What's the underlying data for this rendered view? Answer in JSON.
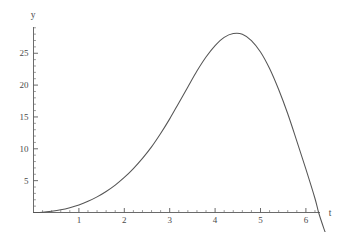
{
  "figure": {
    "kind": "mathematica-plot",
    "background_color": "#ffffff",
    "curve_color": "#555555",
    "axis_color": "#5a5a5a",
    "label_color": "#4a4a4a"
  },
  "chart_data": {
    "type": "line",
    "title": "",
    "subtitle": "",
    "xlabel": "t",
    "ylabel": "y",
    "xlim": [
      0,
      6.6
    ],
    "ylim": [
      -1.5,
      29.5
    ],
    "grid": false,
    "legend": null,
    "legend_position": "none",
    "x_ticks_major": [
      1,
      2,
      3,
      4,
      5,
      6
    ],
    "x_tick_labels": [
      "1",
      "2",
      "3",
      "4",
      "5",
      "6"
    ],
    "x_minor_per_interval": 5,
    "y_ticks_major": [
      5,
      10,
      15,
      20,
      25
    ],
    "y_tick_labels": [
      "5",
      "10",
      "15",
      "20",
      "25"
    ],
    "y_minor_per_interval": 5,
    "axis_origin": [
      0,
      0
    ],
    "peak": {
      "x": 4.4,
      "y": 28.1
    },
    "zero_crossing": 6.28,
    "series": [
      {
        "name": "y(t)",
        "x": [
          0.0,
          0.2,
          0.4,
          0.6,
          0.8,
          1.0,
          1.2,
          1.4,
          1.6,
          1.8,
          2.0,
          2.2,
          2.4,
          2.6,
          2.8,
          3.0,
          3.2,
          3.4,
          3.6,
          3.8,
          4.0,
          4.2,
          4.4,
          4.6,
          4.8,
          5.0,
          5.2,
          5.4,
          5.6,
          5.8,
          6.0,
          6.2,
          6.28,
          6.4,
          6.5,
          6.55
        ],
        "y": [
          0.0,
          0.05,
          0.2,
          0.42,
          0.75,
          1.18,
          1.75,
          2.45,
          3.3,
          4.3,
          5.5,
          6.9,
          8.5,
          10.3,
          12.4,
          14.7,
          17.2,
          19.7,
          22.2,
          24.4,
          26.2,
          27.5,
          28.1,
          28.0,
          27.0,
          25.2,
          22.6,
          19.3,
          15.5,
          11.2,
          6.8,
          2.2,
          0.0,
          -2.6,
          -4.5,
          -5.4
        ]
      }
    ]
  },
  "labels": {
    "y_axis_name": "y",
    "x_axis_name": "t"
  }
}
